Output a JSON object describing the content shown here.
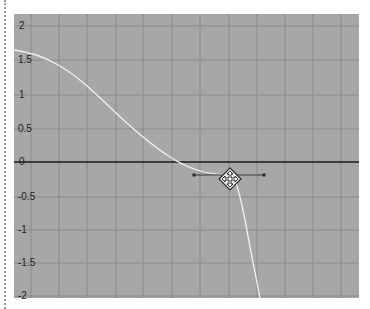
{
  "graph_editor": {
    "y_axis": {
      "labels": [
        "2",
        "1.5",
        "1",
        "0.5",
        "0",
        "-0.5",
        "-1",
        "-1.5",
        "-2"
      ],
      "values": [
        2,
        1.5,
        1,
        0.5,
        0,
        -0.5,
        -1,
        -1.5,
        -2
      ]
    },
    "selected_key": {
      "value": -0.2,
      "handle_icon": "move-cursor-icon",
      "tangent": "flat"
    },
    "colors": {
      "background": "#a7a7a7",
      "grid": "#8a8a8a",
      "zero_line": "#1a1a1a",
      "curve": "#f0f0f0"
    }
  }
}
